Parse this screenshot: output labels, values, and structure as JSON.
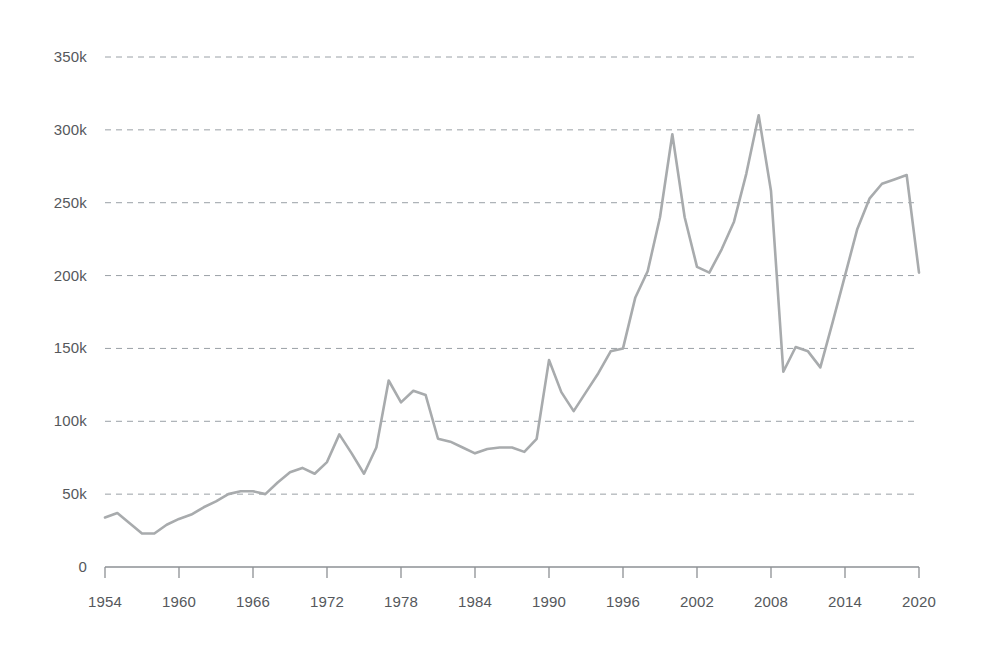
{
  "chart_data": {
    "type": "line",
    "title": "",
    "subtitle": "",
    "xlabel": "",
    "ylabel": "",
    "xlim": [
      1954,
      2020
    ],
    "ylim": [
      0,
      350000
    ],
    "grid": true,
    "legend": false,
    "legend_position": "none",
    "line_color": "#a8abad",
    "grid_color": "#9aa0a6",
    "axis_color": "#8d9094",
    "label_color": "#55585c",
    "y_ticks": [
      0,
      50000,
      100000,
      150000,
      200000,
      250000,
      300000,
      350000
    ],
    "y_tick_labels": [
      "0",
      "50k",
      "100k",
      "150k",
      "200k",
      "250k",
      "300k",
      "350k"
    ],
    "x_ticks": [
      1954,
      1960,
      1966,
      1972,
      1978,
      1984,
      1990,
      1996,
      2002,
      2008,
      2014,
      2020
    ],
    "x_tick_labels": [
      "1954",
      "1960",
      "1966",
      "1972",
      "1978",
      "1984",
      "1990",
      "1996",
      "2002",
      "2008",
      "2014",
      "2020"
    ],
    "x": [
      1954,
      1955,
      1956,
      1957,
      1958,
      1959,
      1960,
      1961,
      1962,
      1963,
      1964,
      1965,
      1966,
      1967,
      1968,
      1969,
      1970,
      1971,
      1972,
      1973,
      1974,
      1975,
      1976,
      1977,
      1978,
      1979,
      1980,
      1981,
      1982,
      1983,
      1984,
      1985,
      1986,
      1987,
      1988,
      1989,
      1990,
      1991,
      1992,
      1993,
      1994,
      1995,
      1996,
      1997,
      1998,
      1999,
      2000,
      2001,
      2002,
      2003,
      2004,
      2005,
      2006,
      2007,
      2008,
      2009,
      2010,
      2011,
      2012,
      2013,
      2014,
      2015,
      2016,
      2017,
      2018,
      2019,
      2020
    ],
    "values": [
      34000,
      37000,
      30000,
      23000,
      23000,
      29000,
      33000,
      36000,
      41000,
      45000,
      50000,
      52000,
      52000,
      50000,
      58000,
      65000,
      68000,
      64000,
      72000,
      91000,
      78000,
      64000,
      82000,
      128000,
      113000,
      121000,
      118000,
      88000,
      86000,
      82000,
      78000,
      81000,
      82000,
      82000,
      79000,
      88000,
      142000,
      120000,
      107000,
      120000,
      133000,
      148000,
      150000,
      185000,
      203000,
      240000,
      297000,
      240000,
      206000,
      202000,
      218000,
      237000,
      270000,
      310000,
      258000,
      134000,
      151000,
      148000,
      137000,
      168000,
      200000,
      232000,
      253000,
      263000,
      266000,
      269000,
      202000
    ],
    "series": [
      {
        "name": "series-1",
        "values": [
          34000,
          37000,
          30000,
          23000,
          23000,
          29000,
          33000,
          36000,
          41000,
          45000,
          50000,
          52000,
          52000,
          50000,
          58000,
          65000,
          68000,
          64000,
          72000,
          91000,
          78000,
          64000,
          82000,
          128000,
          113000,
          121000,
          118000,
          88000,
          86000,
          82000,
          78000,
          81000,
          82000,
          82000,
          79000,
          88000,
          142000,
          120000,
          107000,
          120000,
          133000,
          148000,
          150000,
          185000,
          203000,
          240000,
          297000,
          240000,
          206000,
          202000,
          218000,
          237000,
          270000,
          310000,
          258000,
          134000,
          151000,
          148000,
          137000,
          168000,
          200000,
          232000,
          253000,
          263000,
          266000,
          269000,
          202000
        ]
      }
    ],
    "annotations": []
  }
}
